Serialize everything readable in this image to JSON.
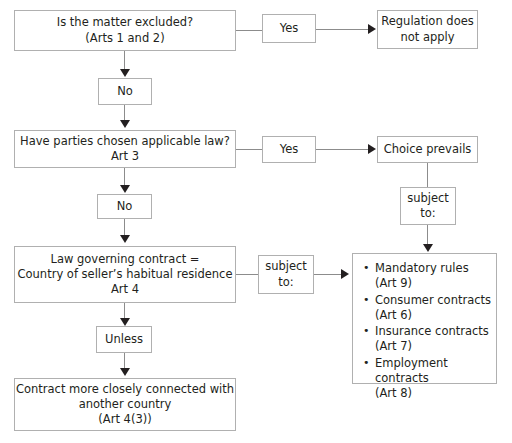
{
  "diagram": {
    "colors": {
      "box_border": "#b0b0b0",
      "connector": "#8c8c8c",
      "arrow": "#231f20",
      "text": "#231f20",
      "background": "#ffffff"
    }
  },
  "nodes": {
    "excluded": {
      "line1": "Is the matter excluded?",
      "line2": "(Arts 1 and 2)"
    },
    "yes1": {
      "label": "Yes"
    },
    "no_apply": {
      "line1": "Regulation does",
      "line2": "not apply"
    },
    "no1": {
      "label": "No"
    },
    "chosen": {
      "line1": "Have parties chosen applicable law?",
      "line2": "Art 3"
    },
    "yes2": {
      "label": "Yes"
    },
    "choice_prevails": {
      "label": "Choice prevails"
    },
    "subject_to_1": {
      "line1": "subject",
      "line2": "to:"
    },
    "no2": {
      "label": "No"
    },
    "law_governing": {
      "line1": "Law governing contract =",
      "line2": "Country of seller’s habitual residence",
      "line3": "Art 4"
    },
    "subject_to_2": {
      "line1": "subject",
      "line2": "to:"
    },
    "unless": {
      "label": "Unless"
    },
    "contract_closer": {
      "line1": "Contract more closely connected with",
      "line2": "another country",
      "line3": "(Art 4(3))"
    },
    "rules_list": {
      "items": [
        {
          "text": "Mandatory rules",
          "article": "(Art 9)"
        },
        {
          "text": "Consumer contracts",
          "article": "(Art 6)"
        },
        {
          "text": "Insurance contracts",
          "article": "(Art 7)"
        },
        {
          "text": "Employment contracts",
          "article": "(Art 8)"
        }
      ]
    }
  }
}
